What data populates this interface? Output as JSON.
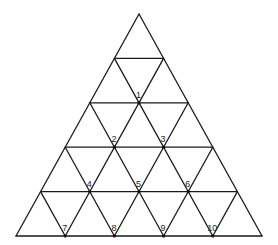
{
  "diagram": {
    "type": "triangular-grid",
    "rows": 5,
    "line_color": "#1a1a1a",
    "background": "#ffffff",
    "geometry": {
      "apex": [
        139,
        14
      ],
      "base_y": 236,
      "base_left_x": 17,
      "base_right_x": 263
    },
    "labels": [
      {
        "text": "1",
        "row": 2,
        "index": 1
      },
      {
        "text": "2",
        "row": 3,
        "index": 1
      },
      {
        "text": "3",
        "row": 3,
        "index": 2
      },
      {
        "text": "4",
        "row": 4,
        "index": 1
      },
      {
        "text": "5",
        "row": 4,
        "index": 2
      },
      {
        "text": "6",
        "row": 4,
        "index": 3
      },
      {
        "text": "7",
        "row": 5,
        "index": 1
      },
      {
        "text": "8",
        "row": 5,
        "index": 2
      },
      {
        "text": "9",
        "row": 5,
        "index": 3
      },
      {
        "text": "10",
        "row": 5,
        "index": 4
      }
    ]
  }
}
